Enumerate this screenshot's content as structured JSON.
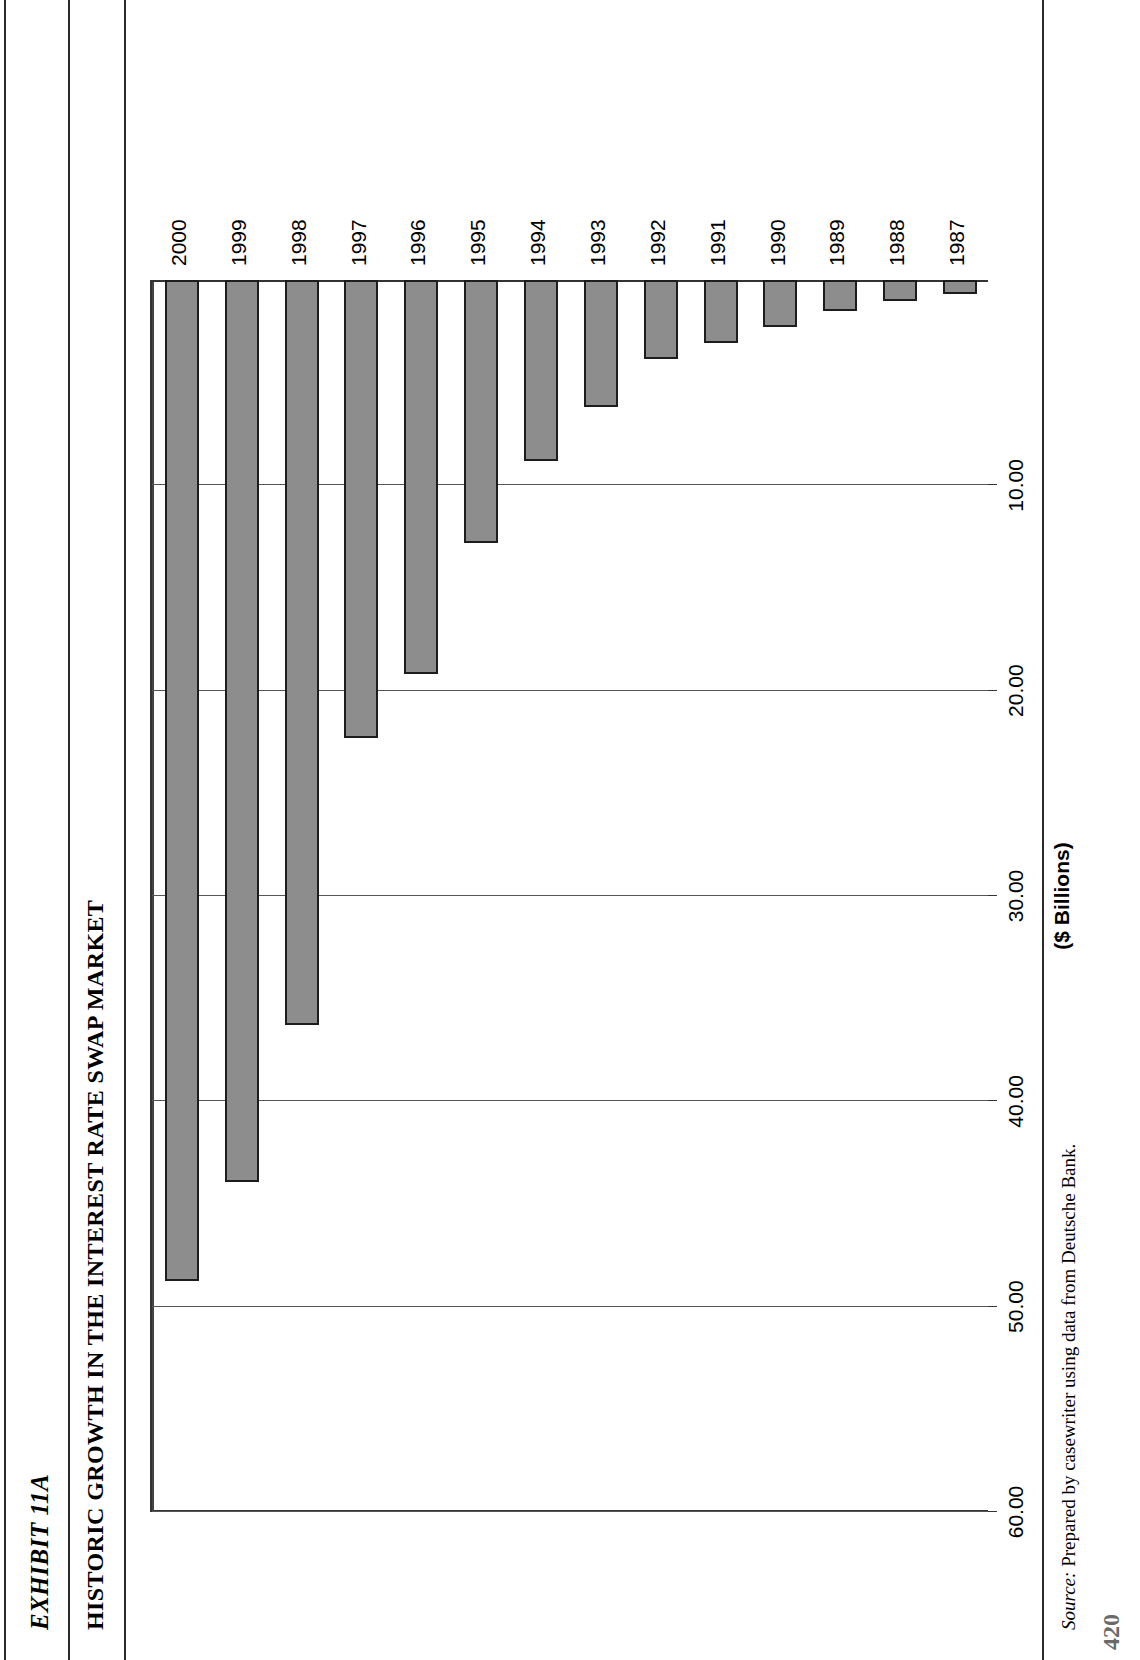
{
  "document": {
    "exhibit_label": "EXHIBIT 11A",
    "exhibit_title": "HISTORIC GROWTH IN THE INTEREST RATE SWAP MARKET",
    "source_prefix": "Source:",
    "source_text": " Prepared by casewriter using data from Deutsche Bank.",
    "page_number": "420"
  },
  "chart_data": {
    "type": "bar",
    "orientation": "horizontal",
    "title": "HISTORIC GROWTH IN THE INTEREST RATE SWAP MARKET",
    "xlabel": "($ Billions)",
    "ylabel": "",
    "categories": [
      "1987",
      "1988",
      "1989",
      "1990",
      "1991",
      "1992",
      "1993",
      "1994",
      "1995",
      "1996",
      "1997",
      "1998",
      "1999",
      "2000"
    ],
    "values": [
      0.68,
      1.01,
      1.5,
      2.31,
      3.07,
      3.85,
      6.18,
      8.82,
      12.81,
      19.17,
      22.29,
      36.26,
      43.94,
      48.77
    ],
    "value_ticks": [
      "10.00",
      "20.00",
      "30.00",
      "40.00",
      "50.00",
      "60.00"
    ],
    "value_tick_numbers": [
      10,
      20,
      30,
      40,
      50,
      60
    ],
    "xlim": [
      0,
      60
    ],
    "grid": true,
    "legend": false,
    "bar_fill_color": "#8d8d8d",
    "bar_border_color": "#1d1d1d",
    "axis_color": "#333333"
  }
}
